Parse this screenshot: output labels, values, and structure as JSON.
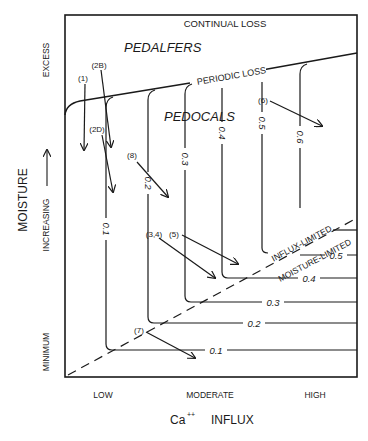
{
  "diagram": {
    "regions": {
      "top": "CONTINUAL LOSS",
      "upper_left": "PEDALFERS",
      "boundary": "PERIODIC LOSS",
      "middle": "PEDOCALS",
      "dashed_upper": "INFLUX-LIMITED",
      "dashed_lower": "MOISTURE-LIMITED"
    },
    "y_axis": {
      "title": "MOISTURE",
      "direction_label": "INCREASING",
      "ticks": [
        "MINIMUM",
        "EXCESS"
      ]
    },
    "x_axis": {
      "title_prefix": "Ca",
      "title_sup": "++",
      "title_suffix": "INFLUX",
      "ticks": [
        "LOW",
        "MODERATE",
        "HIGH"
      ]
    },
    "contours": {
      "vertical": [
        "0.1",
        "0.2",
        "0.3",
        "0.4",
        "0.5",
        "0.6"
      ],
      "horizontal": [
        "0.1",
        "0.2",
        "0.3",
        "0.4",
        "0.5"
      ]
    },
    "arrows": {
      "a1": "(1)",
      "a2b": "(2B)",
      "a2d": "(2D)",
      "a8": "(8)",
      "a34": "(3,4)",
      "a5": "(5)",
      "a6": "(6)",
      "a7": "(7)"
    }
  }
}
